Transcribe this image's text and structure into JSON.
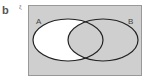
{
  "part_label": "b",
  "universal_symbol": "ξ",
  "sets": [
    {
      "label": "A",
      "shaded": false
    },
    {
      "label": "B",
      "shaded": true
    }
  ],
  "shaded_region": "A′ ∪ B (everything except A only)",
  "colors": {
    "shade": "#cfcfcf",
    "unshaded": "#ffffff",
    "outline": "#222222",
    "frame": "#999999"
  }
}
